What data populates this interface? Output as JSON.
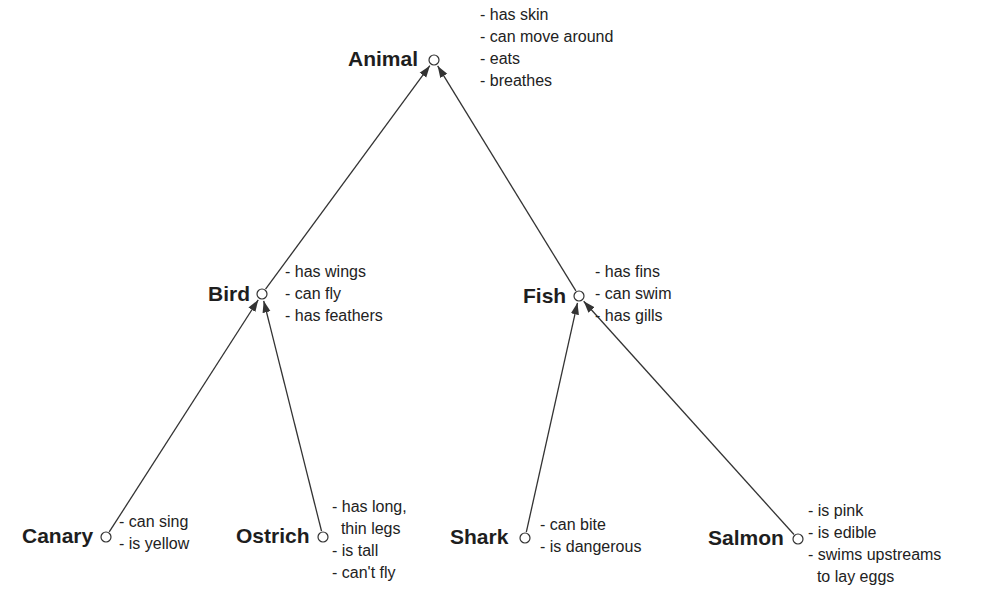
{
  "diagram": {
    "type": "semantic-network",
    "nodes": [
      {
        "id": "animal",
        "name": "Animal",
        "cx": 434,
        "cy": 60,
        "lx": 348,
        "ly": 47,
        "px": 480,
        "py": 4,
        "properties": [
          "- has skin",
          "- can move around",
          "- eats",
          "- breathes"
        ]
      },
      {
        "id": "bird",
        "name": "Bird",
        "cx": 262,
        "cy": 294,
        "lx": 208,
        "ly": 282,
        "px": 285,
        "py": 261,
        "properties": [
          "- has wings",
          "- can fly",
          "- has feathers"
        ]
      },
      {
        "id": "fish",
        "name": "Fish",
        "cx": 579,
        "cy": 296,
        "lx": 523,
        "ly": 284,
        "px": 595,
        "py": 261,
        "properties": [
          "- has fins",
          "- can swim",
          "- has gills"
        ]
      },
      {
        "id": "canary",
        "name": "Canary",
        "cx": 106,
        "cy": 537,
        "lx": 22,
        "ly": 524,
        "px": 119,
        "py": 511,
        "properties": [
          "- can sing",
          "- is yellow"
        ]
      },
      {
        "id": "ostrich",
        "name": "Ostrich",
        "cx": 323,
        "cy": 537,
        "lx": 236,
        "ly": 524,
        "px": 332,
        "py": 496,
        "properties": [
          "- has long,",
          "  thin legs",
          "- is tall",
          "- can't fly"
        ]
      },
      {
        "id": "shark",
        "name": "Shark",
        "cx": 525,
        "cy": 538,
        "lx": 450,
        "ly": 525,
        "px": 540,
        "py": 514,
        "properties": [
          "- can bite",
          "- is dangerous"
        ]
      },
      {
        "id": "salmon",
        "name": "Salmon",
        "cx": 798,
        "cy": 539,
        "lx": 708,
        "ly": 526,
        "px": 808,
        "py": 500,
        "properties": [
          "- is pink",
          "- is edible",
          "- swims upstreams",
          "  to lay eggs"
        ]
      }
    ],
    "edges": [
      {
        "from": "bird",
        "to": "animal"
      },
      {
        "from": "fish",
        "to": "animal"
      },
      {
        "from": "canary",
        "to": "bird"
      },
      {
        "from": "ostrich",
        "to": "bird"
      },
      {
        "from": "shark",
        "to": "fish"
      },
      {
        "from": "salmon",
        "to": "fish"
      }
    ],
    "colors": {
      "line": "#333333",
      "text": "#222222",
      "background": "#ffffff"
    }
  }
}
